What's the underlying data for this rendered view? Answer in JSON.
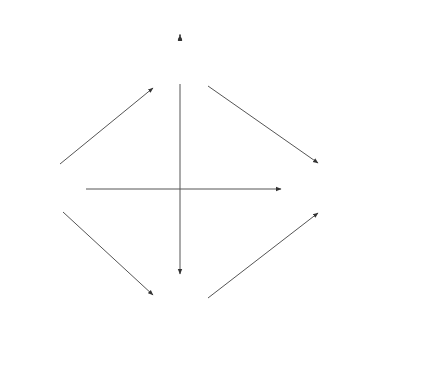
{
  "diagram": {
    "type": "path-model",
    "nodes": {
      "progress": {
        "label": "Progress",
        "kind": "observed"
      },
      "motivation": {
        "label": "Motivation",
        "kind": "observed"
      },
      "satisfaction": {
        "label": "Satisfaction",
        "kind": "observed"
      },
      "grade": {
        "label": "Grade",
        "kind": "observed"
      },
      "e1": {
        "label": "E1",
        "kind": "error"
      },
      "e2": {
        "label": "E2",
        "kind": "error"
      },
      "e3": {
        "label": "E3",
        "kind": "error"
      }
    },
    "paths": {
      "a": {
        "label": "a",
        "from": "Motivation",
        "to": "Progress"
      },
      "b": {
        "label": "b",
        "from": "Motivation",
        "to": "Satisfaction"
      },
      "c": {
        "label": "c",
        "from": "Motivation",
        "to": "Grade"
      },
      "d": {
        "label": "d",
        "from": "Progress",
        "to": "Grade"
      },
      "e": {
        "label": "e",
        "from": "Progress",
        "to": "Satisfaction"
      },
      "f": {
        "label": "f",
        "from": "Grade",
        "to": "Satisfaction"
      }
    },
    "error_loadings": {
      "e1": "1",
      "e2": "1",
      "e3": "1"
    }
  }
}
